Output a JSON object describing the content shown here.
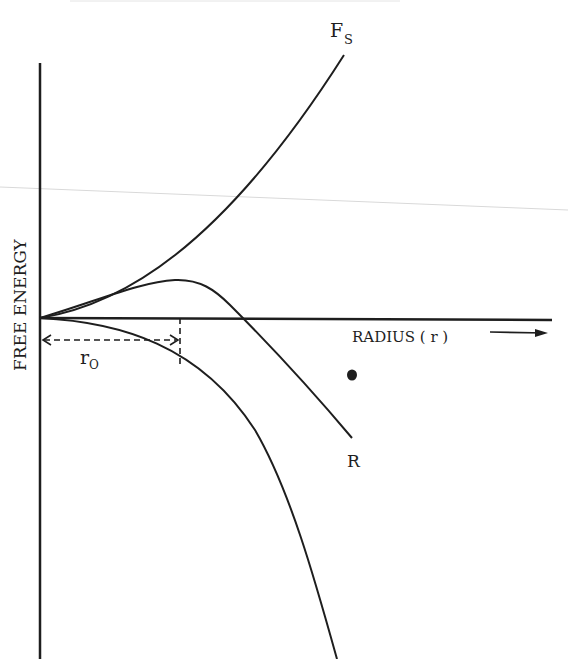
{
  "diagram": {
    "title": "",
    "y_axis_label": "FREE ENERGY",
    "x_axis_label": "RADIUS ( r )",
    "curves": [
      {
        "id": "surface",
        "label_main": "F",
        "label_sub": "S",
        "description": "surface free energy, increasing with r"
      },
      {
        "id": "total",
        "label_main": "R",
        "label_sub": "",
        "description": "total free energy, maximum at critical radius then decreasing"
      },
      {
        "id": "volume",
        "label_main": "",
        "label_sub": "",
        "description": "volume free energy, decreasing with r"
      }
    ],
    "critical_radius": {
      "label_main": "r",
      "label_sub": "O"
    },
    "colors": {
      "ink": "#1e1e1e",
      "background": "#ffffff",
      "scan_line": "#d0d0d0"
    }
  }
}
